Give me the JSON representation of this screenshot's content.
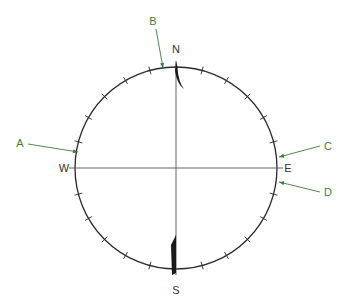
{
  "diagram": {
    "type": "compass-rose",
    "center": [
      176,
      168
    ],
    "radius": 101,
    "tick_interval_deg": 15,
    "colors": {
      "circle": "#2a2a2a",
      "needle": "#1a1a1a",
      "label": "#3d7a3d",
      "cardinal": "#3d7a3d"
    },
    "cardinals": [
      {
        "id": "north",
        "label": "N",
        "x": 176,
        "y": 53
      },
      {
        "id": "south",
        "label": "S",
        "x": 176,
        "y": 294
      },
      {
        "id": "west",
        "label": "W",
        "x": 64,
        "y": 172
      },
      {
        "id": "east",
        "label": "E",
        "x": 288,
        "y": 172
      }
    ],
    "callouts": [
      {
        "id": "a",
        "label": "A",
        "lx": 20,
        "ly": 147,
        "x1": 28,
        "y1": 144,
        "x2": 78,
        "y2": 152
      },
      {
        "id": "b",
        "label": "B",
        "lx": 153,
        "ly": 25,
        "x1": 156,
        "y1": 29,
        "x2": 163,
        "y2": 68
      },
      {
        "id": "c",
        "label": "C",
        "lx": 328,
        "ly": 150,
        "x1": 320,
        "y1": 146,
        "x2": 279,
        "y2": 157
      },
      {
        "id": "d",
        "label": "D",
        "lx": 328,
        "ly": 196,
        "x1": 320,
        "y1": 192,
        "x2": 279,
        "y2": 182
      }
    ]
  }
}
